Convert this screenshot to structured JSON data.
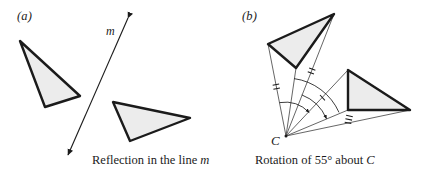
{
  "figure": {
    "width": 431,
    "height": 178,
    "background": "#ffffff",
    "ink_color": "#1b1b1b",
    "shape_fill": "#ebebeb",
    "thin_stroke": "#3a3a3a"
  },
  "panel_a": {
    "label": "(a)",
    "caption_prefix": "Reflection in the line ",
    "caption_italic": "m",
    "line_label": "m",
    "mirror_line": {
      "x1": 128,
      "y1": 18,
      "x2": 68,
      "y2": 155
    },
    "triangle_original": {
      "points": "20,41 80,96 45,107"
    },
    "triangle_image": {
      "points": "113,102 190,118 130,141"
    }
  },
  "panel_b": {
    "label": "(b)",
    "caption_prefix": "Rotation of 55",
    "caption_degree": "°",
    "caption_middle": " about ",
    "caption_italic": "C",
    "center_label": "C",
    "center": {
      "x": 286,
      "y": 136
    },
    "rotation_angle_deg": 55,
    "triangle_original": {
      "points": "268,44 334,14 296,68"
    },
    "triangle_image": {
      "points": "348,70 348,110 410,110"
    },
    "radii": [
      {
        "name": "radius-a-original",
        "x1": 286,
        "y1": 136,
        "x2": 268,
        "y2": 44,
        "ticks": 2,
        "tick_at": 0.52
      },
      {
        "name": "radius-b-original",
        "x1": 286,
        "y1": 136,
        "x2": 334,
        "y2": 14,
        "ticks": 2,
        "tick_at": 0.52
      },
      {
        "name": "radius-c-original",
        "x1": 286,
        "y1": 136,
        "x2": 296,
        "y2": 68,
        "ticks": 0,
        "tick_at": 0
      },
      {
        "name": "radius-a-image",
        "x1": 286,
        "y1": 136,
        "x2": 348,
        "y2": 70,
        "ticks": 1,
        "tick_at": 0.56
      },
      {
        "name": "radius-b-image",
        "x1": 286,
        "y1": 136,
        "x2": 410,
        "y2": 110,
        "ticks": 3,
        "tick_at": 0.5
      },
      {
        "name": "radius-c-image",
        "x1": 286,
        "y1": 136,
        "x2": 348,
        "y2": 110,
        "ticks": 0,
        "tick_at": 0
      }
    ],
    "angle_arcs": [
      {
        "name": "angle-arc-outer",
        "radius": 34,
        "from_deg": 101,
        "to_deg": 47
      },
      {
        "name": "angle-arc-middle",
        "radius": 44,
        "from_deg": 69,
        "to_deg": 23
      },
      {
        "name": "angle-arc-inner",
        "radius": 58,
        "from_deg": 82,
        "to_deg": 24
      }
    ]
  }
}
